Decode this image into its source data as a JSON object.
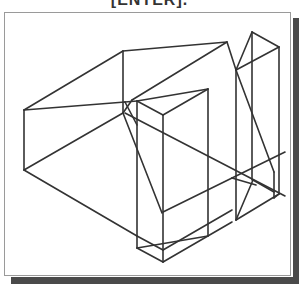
{
  "caption": "[ENTER].",
  "figure": {
    "type": "isometric wireframe",
    "stroke_color": "#333333",
    "frame_border_color": "#9a9a9a",
    "shadow_color": "#4a4a4a"
  }
}
